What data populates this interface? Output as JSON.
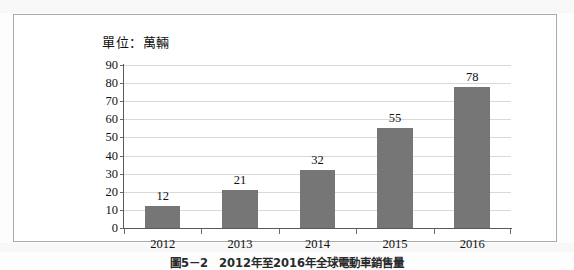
{
  "figure": {
    "unit_label": "單位：萬輛",
    "caption": "圖5－2　2012年至2016年全球電動車銷售量"
  },
  "chart_data": {
    "type": "bar",
    "title": "",
    "subtitle": "",
    "xlabel": "",
    "ylabel": "單位：萬輛",
    "categories": [
      "2012",
      "2013",
      "2014",
      "2015",
      "2016"
    ],
    "values": [
      12,
      21,
      32,
      55,
      78
    ],
    "data_labels": [
      "12",
      "21",
      "32",
      "55",
      "78"
    ],
    "ylim": [
      0,
      90
    ],
    "ytick_labels": [
      "0",
      "10",
      "20",
      "30",
      "40",
      "50",
      "60",
      "70",
      "80",
      "90"
    ],
    "ytick_values": [
      0,
      10,
      20,
      30,
      40,
      50,
      60,
      70,
      80,
      90
    ],
    "grid": true,
    "legend": false,
    "legend_position": "none",
    "series": [
      {
        "name": "銷售量",
        "values": [
          12,
          21,
          32,
          55,
          78
        ],
        "color": "#767676"
      }
    ],
    "colors": {
      "bar": "#767676",
      "gridline": "#d9d9d9",
      "axis": "#5a5a5a",
      "frame": "#a9a9a9",
      "text": "#111111",
      "background": "#ffffff"
    }
  }
}
